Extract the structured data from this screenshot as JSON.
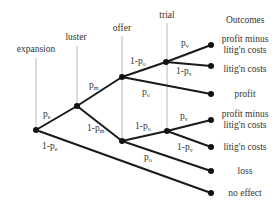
{
  "diagram": {
    "type": "decision-tree",
    "stages": [
      {
        "label": "expansion"
      },
      {
        "label": "luster"
      },
      {
        "label": "offer"
      },
      {
        "label": "trial"
      }
    ],
    "outcomes_header": "Outcomes",
    "edge_labels": {
      "pe": "p",
      "pe_sub": "e",
      "one_minus_pe": "1-p",
      "one_minus_pe_sub": "e",
      "pm": "p",
      "pm_sub": "m",
      "one_minus_pm": "1-p",
      "one_minus_pm_sub": "m",
      "upper_one_minus_po": "1-p",
      "upper_one_minus_po_sub": "o",
      "upper_po": "p",
      "upper_po_sub": "o",
      "upper_pv": "p",
      "upper_pv_sub": "v",
      "upper_one_minus_pv": "1-p",
      "upper_one_minus_pv_sub": "v",
      "lower_one_minus_po": "1-p",
      "lower_one_minus_po_sub": "o",
      "lower_po": "p",
      "lower_po_sub": "o",
      "lower_pv": "p",
      "lower_pv_sub": "v",
      "lower_one_minus_pv": "1-p",
      "lower_one_minus_pv_sub": "v"
    },
    "outcomes": [
      {
        "line1": "profit minus",
        "line2": "litig'n costs"
      },
      {
        "line1": "litig'n costs"
      },
      {
        "line1": "profit"
      },
      {
        "line1": "profit minus",
        "line2": "litig'n costs"
      },
      {
        "line1": "litig'n costs"
      },
      {
        "line1": "loss"
      },
      {
        "line1": "no effect"
      }
    ]
  }
}
